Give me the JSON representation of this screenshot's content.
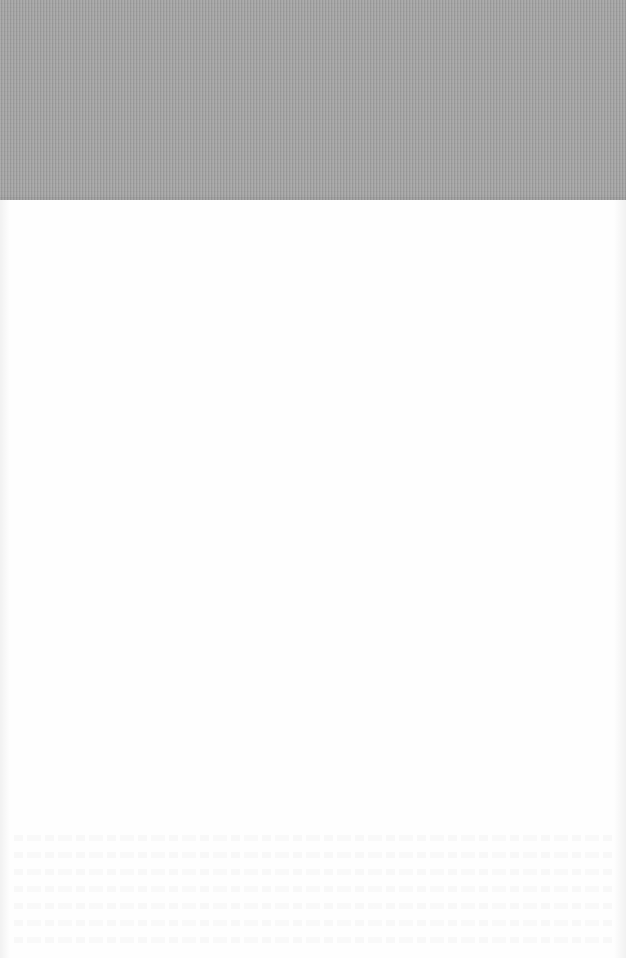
{
  "document": {
    "type": "scanned-page",
    "regions": {
      "top_band": {
        "description": "gray textured band",
        "color": "#a3a3a3"
      },
      "page": {
        "description": "blank white page",
        "color": "#fefefe"
      },
      "bleed_through": {
        "description": "illegible show-through text near bottom",
        "rows": 7
      }
    },
    "text": ""
  },
  "colors": {
    "band": "#a3a3a3",
    "paper": "#fefefe"
  }
}
